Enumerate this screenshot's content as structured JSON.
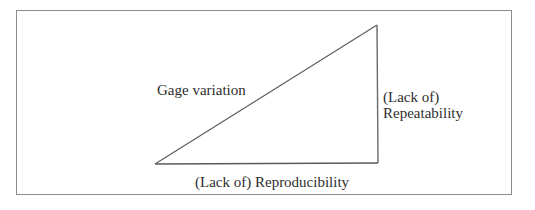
{
  "diagram": {
    "type": "right-triangle",
    "labels": {
      "hypotenuse": "Gage variation",
      "vertical_leg_line1": "(Lack of)",
      "vertical_leg_line2": "Repeatability",
      "horizontal_leg": "(Lack of) Reproducibility"
    },
    "colors": {
      "line": "#555555",
      "frame": "#8c8c8c",
      "text": "#2e2e2e",
      "background": "#ffffff"
    }
  }
}
